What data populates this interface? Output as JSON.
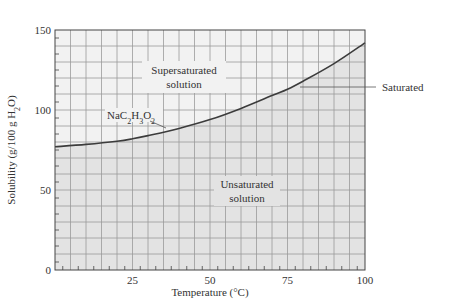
{
  "chart_data": {
    "type": "line",
    "title": "",
    "xlabel": "Temperature (°C)",
    "ylabel": "Solubility (g/100 g H2O)",
    "xlim": [
      0,
      100
    ],
    "ylim": [
      0,
      150
    ],
    "xticks": [
      25,
      50,
      75,
      100
    ],
    "yticks": [
      0,
      50,
      100,
      150
    ],
    "grid": true,
    "grid_minor_x_step": 5,
    "grid_minor_y_step": 10,
    "series": [
      {
        "name": "NaC2H3O2",
        "x": [
          0,
          10,
          20,
          25,
          30,
          40,
          50,
          60,
          70,
          75,
          80,
          90,
          100
        ],
        "values": [
          77,
          78.5,
          80.5,
          82,
          84,
          88.5,
          94,
          101,
          109,
          113,
          118,
          129,
          142
        ]
      }
    ],
    "annotations": [
      {
        "text": "Supersaturated",
        "text2": "solution",
        "region": "above curve"
      },
      {
        "text": "Unsaturated",
        "text2": "solution",
        "region": "below curve"
      },
      {
        "text": "Saturated",
        "target": "curve",
        "leader_line": true
      },
      {
        "text": "NaC2H3O2",
        "target": "curve",
        "leader_line": true
      }
    ],
    "legend": "none"
  },
  "labels": {
    "x_axis_title": "Temperature (°C)",
    "y_axis_title_prefix": "Solubility (g/100 g H",
    "y_axis_title_sub": "2",
    "y_axis_title_suffix": "O)",
    "supersaturated_line1": "Supersaturated",
    "supersaturated_line2": "solution",
    "unsaturated_line1": "Unsaturated",
    "unsaturated_line2": "solution",
    "saturated": "Saturated",
    "compound": {
      "p1": "NaC",
      "s1": "2",
      "p2": "H",
      "s2": "3",
      "p3": "O",
      "s3": "2"
    }
  },
  "colors": {
    "unsaturated_fill": "#e3e3e3",
    "supersaturated_fill": "#f2f2f2",
    "grid": "#9a9a9a",
    "curve": "#3c3c3c",
    "axis": "#444444"
  }
}
